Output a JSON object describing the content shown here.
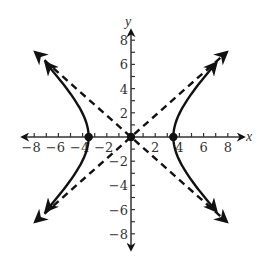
{
  "chart_data": {
    "type": "line",
    "title": "",
    "xlabel": "x",
    "ylabel": "y",
    "xlim": [
      -9,
      9
    ],
    "ylim": [
      -9,
      9
    ],
    "grid": false,
    "x_ticks": [
      -8,
      -7,
      -6,
      -5,
      -4,
      -3,
      -2,
      -1,
      1,
      2,
      3,
      4,
      5,
      6,
      7,
      8
    ],
    "y_ticks": [
      -8,
      -7,
      -6,
      -5,
      -4,
      -3,
      -2,
      -1,
      1,
      2,
      3,
      4,
      5,
      6,
      7,
      8
    ],
    "x_tick_labels": [
      "-8",
      "-6",
      "-4",
      "-2",
      "2",
      "4",
      "6",
      "8"
    ],
    "y_tick_labels": [
      "8",
      "6",
      "4",
      "2",
      "-2",
      "-4",
      "-6",
      "-8"
    ],
    "series": [
      {
        "name": "hyperbola",
        "style": "solid",
        "equation": "x^2/12 - y^2/12 = 1",
        "branches": [
          {
            "name": "right-branch",
            "points": [
              [
                7.9,
                6.1
              ],
              [
                6,
                4.9
              ],
              [
                5,
                3.6
              ],
              [
                4,
                2.0
              ],
              [
                3.5,
                0
              ],
              [
                4,
                -2.0
              ],
              [
                5,
                -3.6
              ],
              [
                6,
                -4.9
              ],
              [
                7.9,
                -6.1
              ]
            ]
          },
          {
            "name": "left-branch",
            "points": [
              [
                -7.9,
                6.1
              ],
              [
                -6,
                4.9
              ],
              [
                -5,
                3.6
              ],
              [
                -4,
                2.0
              ],
              [
                -3.5,
                0
              ],
              [
                -4,
                -2.0
              ],
              [
                -5,
                -3.6
              ],
              [
                -6,
                -4.9
              ],
              [
                -7.9,
                -6.1
              ]
            ]
          }
        ]
      },
      {
        "name": "asymptote y = x",
        "style": "dashed",
        "points": [
          [
            -7.9,
            -7.0
          ],
          [
            7.9,
            7.0
          ]
        ]
      },
      {
        "name": "asymptote y = -x",
        "style": "dashed",
        "points": [
          [
            -7.9,
            7.0
          ],
          [
            7.9,
            -7.0
          ]
        ]
      }
    ],
    "points": [
      {
        "label": "left vertex",
        "x": -3.5,
        "y": 0
      },
      {
        "label": "center",
        "x": 0,
        "y": 0
      },
      {
        "label": "right vertex",
        "x": 3.5,
        "y": 0
      }
    ]
  },
  "labels": {
    "x_axis": "x",
    "y_axis": "y"
  }
}
